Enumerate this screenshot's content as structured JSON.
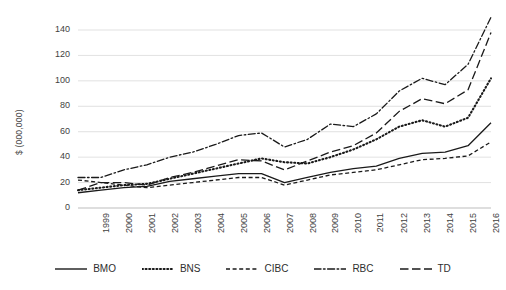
{
  "chart_data": {
    "type": "line",
    "title": "",
    "xlabel": "",
    "ylabel": "$ (000,000)",
    "x": [
      1999,
      2000,
      2001,
      2002,
      2003,
      2004,
      2005,
      2006,
      2007,
      2008,
      2009,
      2010,
      2011,
      2012,
      2013,
      2014,
      2015,
      2016,
      2017
    ],
    "xtick_labels": [
      "1999",
      "2000",
      "2001",
      "2002",
      "2003",
      "2004",
      "2005",
      "2006",
      "2007",
      "2008",
      "2009",
      "2010",
      "2011",
      "2012",
      "2013",
      "2014",
      "2015",
      "2016",
      "2017"
    ],
    "ytick_labels": [
      "0",
      "20",
      "40",
      "60",
      "80",
      "100",
      "120",
      "140"
    ],
    "yticks": [
      0,
      20,
      40,
      60,
      80,
      100,
      120,
      140
    ],
    "ylim": [
      0,
      155
    ],
    "grid": "horizontal",
    "legend_position": "bottom",
    "series": [
      {
        "name": "BMO",
        "style": "solid",
        "values": [
          12,
          14,
          16,
          17,
          21,
          23,
          25,
          27,
          27,
          20,
          24,
          28,
          31,
          33,
          39,
          43,
          44,
          49,
          67
        ]
      },
      {
        "name": "BNS",
        "style": "dotted",
        "values": [
          14,
          16,
          18,
          19,
          23,
          27,
          31,
          35,
          39,
          36,
          35,
          40,
          46,
          54,
          64,
          69,
          64,
          71,
          102
        ]
      },
      {
        "name": "CIBC",
        "style": "dashed",
        "values": [
          22,
          20,
          18,
          16,
          18,
          20,
          22,
          24,
          24,
          18,
          22,
          26,
          28,
          30,
          34,
          38,
          39,
          41,
          52
        ]
      },
      {
        "name": "RBC",
        "style": "dashdot",
        "values": [
          24,
          24,
          30,
          34,
          40,
          44,
          50,
          57,
          59,
          48,
          54,
          66,
          64,
          74,
          92,
          102,
          97,
          113,
          150
        ]
      },
      {
        "name": "TD",
        "style": "longdash",
        "values": [
          14,
          20,
          20,
          18,
          24,
          28,
          33,
          38,
          37,
          30,
          37,
          44,
          49,
          59,
          76,
          86,
          82,
          93,
          138
        ]
      }
    ]
  }
}
